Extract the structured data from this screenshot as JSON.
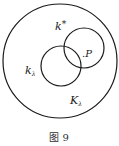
{
  "figure": {
    "caption": "图 9",
    "colors": {
      "stroke": "#1a1a1a",
      "background": "#ffffff"
    },
    "circles": [
      {
        "id": "outer",
        "label": "K_λ",
        "cx": 60,
        "cy": 61,
        "r": 57
      },
      {
        "id": "upper-right",
        "label": "k*",
        "cx": 84,
        "cy": 48,
        "r": 20
      },
      {
        "id": "lower-left",
        "label": "k_λ",
        "cx": 61,
        "cy": 66,
        "r": 20
      }
    ],
    "labels": {
      "k_star_base": "k",
      "k_star_sup": "*",
      "k_lambda_base": "k",
      "k_lambda_sub": "λ",
      "K_lambda_base": "K",
      "K_lambda_sub": "λ",
      "point_dot": ".",
      "point_name": "P"
    }
  }
}
